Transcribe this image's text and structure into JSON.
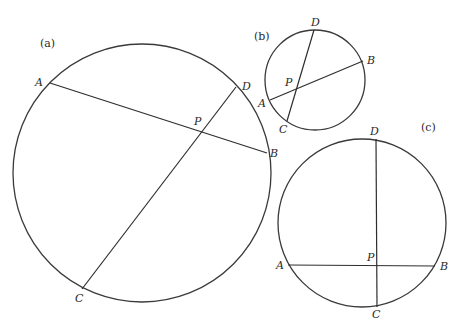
{
  "figure": {
    "panels": [
      {
        "id": "a",
        "label": "(a)",
        "label_pos": [
          40,
          47
        ],
        "circle": {
          "cx": 142,
          "cy": 173,
          "r": 129
        },
        "chords": [
          {
            "name": "AB",
            "from": [
              50,
              83
            ],
            "to": [
              267,
              153
            ]
          },
          {
            "name": "CD",
            "from": [
              236,
              87
            ],
            "to": [
              82,
              289
            ]
          }
        ],
        "points": [
          {
            "name": "A",
            "label": "A",
            "x": 35,
            "y": 86
          },
          {
            "name": "B",
            "label": "B",
            "x": 270,
            "y": 157
          },
          {
            "name": "C",
            "label": "C",
            "x": 75,
            "y": 302
          },
          {
            "name": "D",
            "label": "D",
            "x": 242,
            "y": 90
          },
          {
            "name": "P",
            "label": "P",
            "x": 194,
            "y": 125
          }
        ]
      },
      {
        "id": "b",
        "label": "(b)",
        "label_pos": [
          254,
          40
        ],
        "circle": {
          "cx": 315,
          "cy": 80,
          "r": 50
        },
        "chords": [
          {
            "name": "AB",
            "from": [
              270,
              100
            ],
            "to": [
              363,
              61
            ]
          },
          {
            "name": "CD",
            "from": [
              314,
              30
            ],
            "to": [
              287,
              121
            ]
          }
        ],
        "points": [
          {
            "name": "A",
            "label": "A",
            "x": 258,
            "y": 107
          },
          {
            "name": "B",
            "label": "B",
            "x": 367,
            "y": 64
          },
          {
            "name": "C",
            "label": "C",
            "x": 279,
            "y": 133
          },
          {
            "name": "D",
            "label": "D",
            "x": 311,
            "y": 26
          },
          {
            "name": "P",
            "label": "P",
            "x": 285,
            "y": 86
          }
        ]
      },
      {
        "id": "c",
        "label": "(c)",
        "label_pos": [
          421,
          131
        ],
        "circle": {
          "cx": 362,
          "cy": 223,
          "r": 84
        },
        "chords": [
          {
            "name": "AB",
            "from": [
              288,
              265
            ],
            "to": [
              435,
              266
            ]
          },
          {
            "name": "CD",
            "from": [
              376,
              139
            ],
            "to": [
              377,
              307
            ]
          }
        ],
        "points": [
          {
            "name": "A",
            "label": "A",
            "x": 276,
            "y": 269
          },
          {
            "name": "B",
            "label": "B",
            "x": 440,
            "y": 270
          },
          {
            "name": "C",
            "label": "C",
            "x": 372,
            "y": 318
          },
          {
            "name": "D",
            "label": "D",
            "x": 370,
            "y": 135
          },
          {
            "name": "P",
            "label": "P",
            "x": 367,
            "y": 261
          }
        ]
      }
    ]
  },
  "colors": {
    "stroke": "#3a3a3a",
    "text": "#2a2a2a",
    "background": "#ffffff"
  }
}
